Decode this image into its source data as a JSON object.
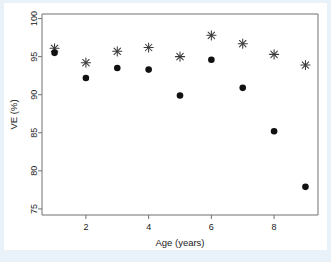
{
  "figure": {
    "background_color": "#e8f2f8",
    "panel_color": "#ffffff"
  },
  "chart_data": {
    "type": "scatter",
    "title": "",
    "xlabel": "Age (years)",
    "ylabel": "VE (%)",
    "x": [
      1,
      2,
      3,
      4,
      5,
      6,
      7,
      8,
      9
    ],
    "xlim": [
      0.6,
      9.4
    ],
    "ylim": [
      74.2,
      100.6
    ],
    "xticks": [
      2,
      4,
      6,
      8
    ],
    "xtick_labels": [
      "2",
      "4",
      "6",
      "8"
    ],
    "yticks": [
      75,
      80,
      85,
      90,
      95,
      100
    ],
    "ytick_labels": [
      "75",
      "80",
      "85",
      "90",
      "95",
      "100"
    ],
    "grid": false,
    "legend": false,
    "legend_position": "none",
    "series": [
      {
        "name": "asterisk",
        "marker": "asterisk",
        "color": "#3a3a3a",
        "values": [
          96.1,
          94.2,
          95.7,
          96.2,
          95.0,
          97.8,
          96.7,
          95.3,
          93.9
        ]
      },
      {
        "name": "circle",
        "marker": "filled-circle",
        "color": "#111111",
        "values": [
          95.5,
          92.2,
          93.5,
          93.3,
          89.9,
          94.6,
          90.9,
          85.2,
          77.9
        ]
      }
    ]
  }
}
